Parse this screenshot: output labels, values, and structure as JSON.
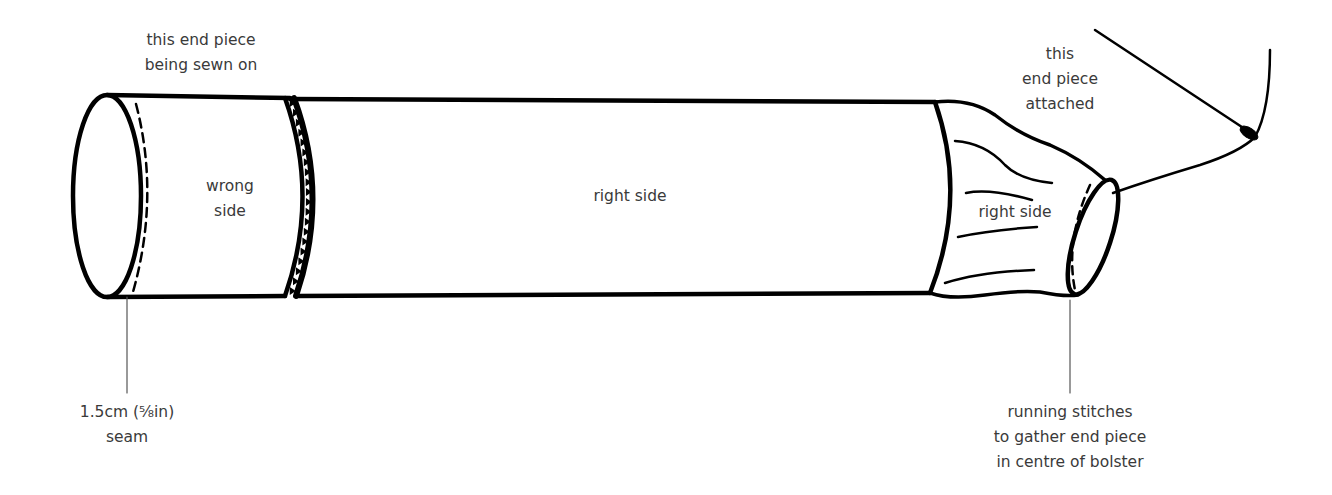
{
  "diagram": {
    "stroke_color": "#000000",
    "label_color": "#3a3a3a",
    "labels": {
      "top_left": [
        "this end piece",
        "being sewn on"
      ],
      "left_panel": [
        "wrong",
        "side"
      ],
      "main_body": "right side",
      "top_right": [
        "this",
        "end piece",
        "attached"
      ],
      "right_end": "right side",
      "seam_callout": [
        "1.5cm (⁵⁄₈in)",
        "seam"
      ],
      "stitch_callout": [
        "running stitches",
        "to gather end piece",
        "in centre of bolster"
      ]
    }
  }
}
